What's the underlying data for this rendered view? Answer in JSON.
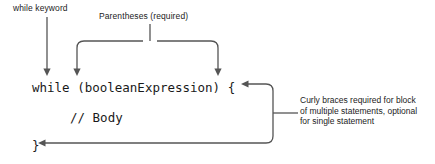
{
  "diagram": {
    "line_color": "#555555",
    "text_color": "#1c1c1c",
    "background": "#ffffff"
  },
  "annotations": {
    "while_keyword": "while keyword",
    "parentheses": "Parentheses (required)",
    "curly_braces_line1": "Curly braces required for block",
    "curly_braces_line2": "of multiple statements, optional",
    "curly_braces_line3": "for single statement"
  },
  "code": {
    "header": "while (booleanExpression) {",
    "body": "// Body",
    "closing": "}"
  }
}
